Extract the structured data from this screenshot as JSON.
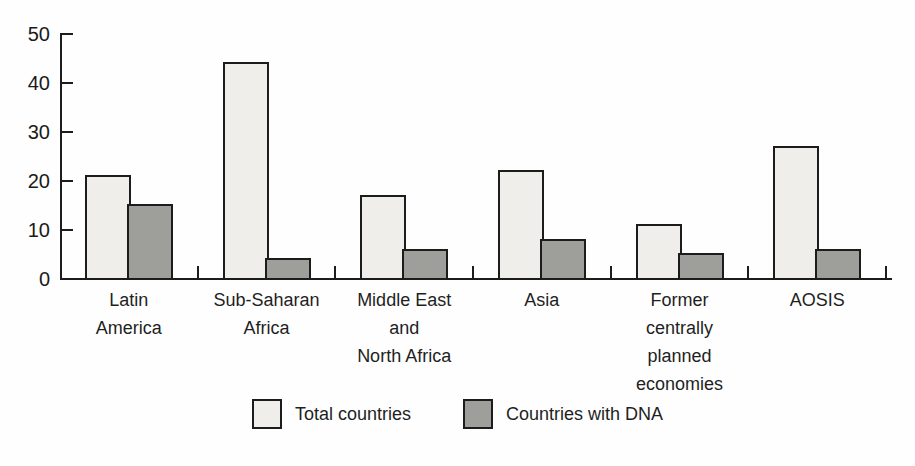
{
  "chart_data": {
    "type": "bar",
    "title": "",
    "xlabel": "",
    "ylabel": "",
    "categories": [
      "Latin America",
      "Sub-Saharan Africa",
      "Middle East and North Africa",
      "Asia",
      "Former centrally planned economies",
      "AOSIS"
    ],
    "category_label_lines": [
      [
        "Latin",
        "America"
      ],
      [
        "Sub-Saharan",
        "Africa"
      ],
      [
        "Middle East",
        "and",
        "North Africa"
      ],
      [
        "Asia"
      ],
      [
        "Former",
        "centrally",
        "planned",
        "economies"
      ],
      [
        "AOSIS"
      ]
    ],
    "series": [
      {
        "name": "Total countries",
        "color": "#efeeeb",
        "values": [
          21,
          44,
          17,
          22,
          11,
          27
        ]
      },
      {
        "name": "Countries with DNA",
        "color": "#9e9e9b",
        "values": [
          15,
          4,
          6,
          8,
          5,
          6
        ]
      }
    ],
    "ylim": [
      0,
      50
    ],
    "yticks": [
      0,
      10,
      20,
      30,
      40,
      50
    ],
    "grid": false,
    "legend_position": "bottom",
    "colors": {
      "axis": "#1c1c1c",
      "bar_border": "#1c1c1c",
      "text": "#1a1a1a",
      "background": "#fefefe"
    }
  }
}
